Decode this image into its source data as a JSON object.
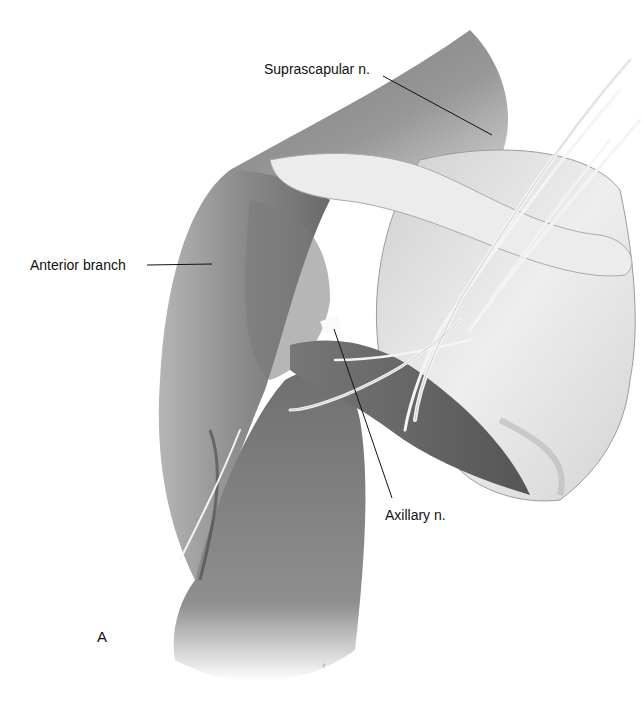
{
  "figure": {
    "panel_letter": "A",
    "labels": [
      {
        "id": "suprascapular",
        "text": "Suprascapular n.",
        "x": 264,
        "y": 62,
        "line": [
          [
            383,
            76
          ],
          [
            492,
            135
          ]
        ]
      },
      {
        "id": "anterior-branch",
        "text": "Anterior branch",
        "x": 30,
        "y": 258,
        "line": [
          [
            147,
            265
          ],
          [
            212,
            264
          ]
        ]
      },
      {
        "id": "axillary",
        "text": "Axillary n.",
        "x": 385,
        "y": 508,
        "line": [
          [
            392,
            498
          ],
          [
            334,
            329
          ]
        ]
      }
    ],
    "signature": "artist signature"
  },
  "colors": {
    "background": "#ffffff",
    "label_text": "#111111",
    "leader_line": "#111111",
    "muscle_dark": "#5a5a5a",
    "muscle_mid": "#8a8a8a",
    "muscle_light": "#b8b8b8",
    "bone": "#e6e6e6",
    "nerve": "#f2f2f2"
  }
}
